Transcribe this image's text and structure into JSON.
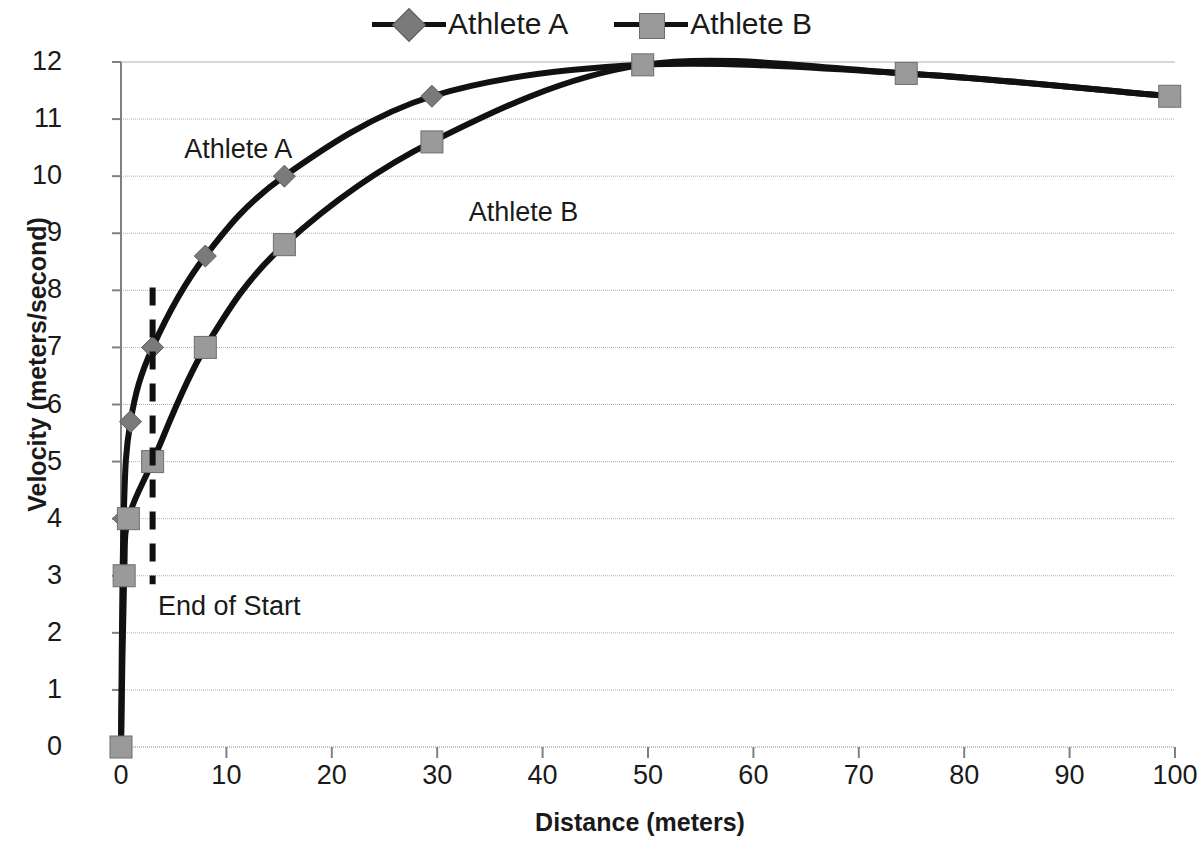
{
  "legend": {
    "position": "top-center",
    "entries": [
      {
        "label": "Athlete A",
        "marker": "diamond-marker-icon"
      },
      {
        "label": "Athlete B",
        "marker": "square-marker-icon"
      }
    ]
  },
  "annotations": [
    {
      "id": "athlete-a-annotation",
      "text": "Athlete A",
      "x": 6,
      "y": 10.45
    },
    {
      "id": "athlete-b-annotation",
      "text": "Athlete B",
      "x": 33,
      "y": 9.35
    },
    {
      "id": "end-of-start-annotation",
      "text": "End of Start",
      "x": 3.5,
      "y": 2.45
    }
  ],
  "chart_data": {
    "type": "line",
    "title": "",
    "xlabel": "Distance (meters)",
    "ylabel": "Velocity (meters/second)",
    "xlim": [
      0,
      100
    ],
    "ylim": [
      0,
      12
    ],
    "xticks": [
      0,
      10,
      20,
      30,
      40,
      50,
      60,
      70,
      80,
      90,
      100
    ],
    "yticks": [
      0,
      1,
      2,
      3,
      4,
      5,
      6,
      7,
      8,
      9,
      10,
      11,
      12
    ],
    "grid": "horizontal",
    "legend_position": "top-center",
    "colors": {
      "line": "#111111",
      "marker_a": "#7a7a7a",
      "marker_b": "#9a9a9a",
      "grid": "#b0b0b0",
      "axis": "#808080",
      "text": "#1a1a1a"
    },
    "series": [
      {
        "name": "Athlete A",
        "marker": "diamond",
        "points": [
          {
            "x": 0.0,
            "y": 0.0
          },
          {
            "x": 0.25,
            "y": 4.0
          },
          {
            "x": 0.9,
            "y": 5.7
          },
          {
            "x": 3.0,
            "y": 7.0
          },
          {
            "x": 8.0,
            "y": 8.6
          },
          {
            "x": 15.5,
            "y": 10.0
          },
          {
            "x": 29.5,
            "y": 11.4
          },
          {
            "x": 49.5,
            "y": 11.95
          },
          {
            "x": 74.5,
            "y": 11.8
          },
          {
            "x": 99.5,
            "y": 11.4
          }
        ]
      },
      {
        "name": "Athlete B",
        "marker": "square",
        "points": [
          {
            "x": 0.0,
            "y": 0.0
          },
          {
            "x": 0.3,
            "y": 3.0
          },
          {
            "x": 0.7,
            "y": 4.0
          },
          {
            "x": 3.0,
            "y": 5.0
          },
          {
            "x": 8.0,
            "y": 7.0
          },
          {
            "x": 15.5,
            "y": 8.8
          },
          {
            "x": 29.5,
            "y": 10.6
          },
          {
            "x": 49.5,
            "y": 11.95
          },
          {
            "x": 74.5,
            "y": 11.8
          },
          {
            "x": 99.5,
            "y": 11.4
          }
        ]
      }
    ],
    "reference_line": {
      "label": "End of Start",
      "x": 3.0,
      "y_from": 2.85,
      "y_to": 8.05,
      "style": "dashed"
    }
  }
}
